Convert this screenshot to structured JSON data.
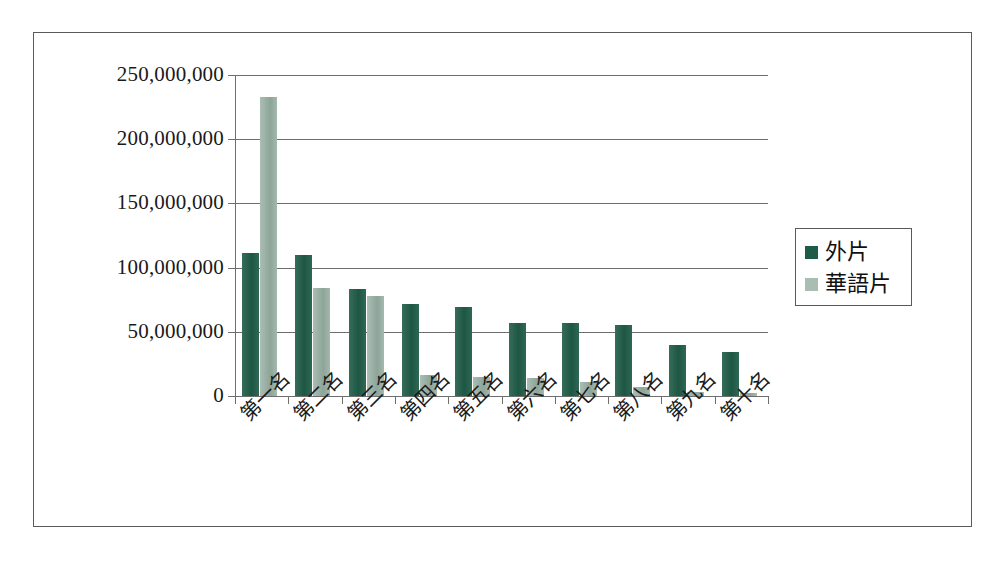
{
  "chart_data": {
    "type": "bar",
    "title": "",
    "subtitle": "",
    "xlabel": "",
    "ylabel": "",
    "categories": [
      "第一名",
      "第二名",
      "第三名",
      "第四名",
      "第五名",
      "第六名",
      "第七名",
      "第八名",
      "第九名",
      "第十名"
    ],
    "series": [
      {
        "name": "外片",
        "color": "#1f5c47",
        "values": [
          111000000,
          110000000,
          83000000,
          72000000,
          69000000,
          57000000,
          57000000,
          55000000,
          40000000,
          34000000
        ]
      },
      {
        "name": "華語片",
        "color": "#93ab9f",
        "values": [
          233000000,
          84000000,
          78000000,
          16000000,
          15000000,
          14000000,
          11000000,
          7000000,
          3500000,
          2500000
        ]
      }
    ],
    "ylim": [
      0,
      250000000
    ],
    "ytick_values": [
      0,
      50000000,
      100000000,
      150000000,
      200000000,
      250000000
    ],
    "ytick_labels": [
      "0",
      "50,000,000",
      "100,000,000",
      "150,000,000",
      "200,000,000",
      "250,000,000"
    ],
    "grid": true,
    "grid_axis": "y",
    "legend_position": "right",
    "legend_entries": [
      "外片",
      "華語片"
    ],
    "bar_orientation": "vertical",
    "grouped": true
  },
  "figure": {
    "background_color": "#ffffff",
    "frame_color": "#5a5a5a",
    "axis_color": "#6e6e6e",
    "text_color": "#1a1a1a"
  }
}
